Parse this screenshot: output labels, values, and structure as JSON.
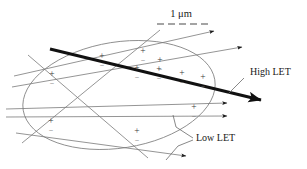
{
  "figure": {
    "name": "radiation-track-structure-in-cell-nucleus",
    "background_color": "#ffffff",
    "width": 307,
    "height": 169
  },
  "scale_bar": {
    "label": "1 μm",
    "label_x": 181,
    "label_y": 17,
    "bar_y": 24,
    "bar_x_start": 157,
    "bar_x_end": 208,
    "dash_pattern": "7,4",
    "color": "#4a4a4a"
  },
  "labels": {
    "high_let": {
      "text": "High LET",
      "x": 250,
      "y": 75,
      "color": "#1a1a1a"
    },
    "low_let": {
      "text": "Low LET",
      "x": 196,
      "y": 141,
      "color": "#1a1a1a"
    }
  },
  "nucleus": {
    "name": "cell-nucleus-ellipse",
    "cx": 119,
    "cy": 95,
    "rx": 97,
    "ry": 53,
    "rotation": -9,
    "stroke": "#8a8a8a",
    "stroke_width": 0.9,
    "fill": "none"
  },
  "high_let_track": {
    "name": "high-let-track",
    "x1": 50,
    "y1": 49,
    "x2": 261,
    "y2": 100,
    "stroke": "#111111",
    "stroke_width": 3.0,
    "arrowhead": "filled-triangle"
  },
  "low_let_tracks": [
    {
      "id": "track-a",
      "x1": 14,
      "y1": 76,
      "x2": 214,
      "y2": 31,
      "arrow": true
    },
    {
      "id": "track-b",
      "x1": 12,
      "y1": 87,
      "x2": 242,
      "y2": 47,
      "arrow": true
    },
    {
      "id": "track-c",
      "x1": 6,
      "y1": 109,
      "x2": 227,
      "y2": 103,
      "arrow": true
    },
    {
      "id": "track-d",
      "x1": 6,
      "y1": 117,
      "x2": 227,
      "y2": 116,
      "arrow": true
    },
    {
      "id": "track-e",
      "x1": 16,
      "y1": 133,
      "x2": 186,
      "y2": 156,
      "arrow": true
    },
    {
      "id": "track-f",
      "x1": 28,
      "y1": 55,
      "x2": 148,
      "y2": 158,
      "arrow": false
    },
    {
      "id": "track-g",
      "x1": 22,
      "y1": 143,
      "x2": 160,
      "y2": 30,
      "arrow": false
    }
  ],
  "low_let_stroke": "#7a7a7a",
  "low_let_stroke_width": 0.8,
  "ion_pairs": [
    {
      "x": 102,
      "y": 59
    },
    {
      "x": 143,
      "y": 54
    },
    {
      "x": 160,
      "y": 63
    },
    {
      "x": 52,
      "y": 77
    },
    {
      "x": 137,
      "y": 71
    },
    {
      "x": 159,
      "y": 72
    },
    {
      "x": 182,
      "y": 76
    },
    {
      "x": 203,
      "y": 80
    },
    {
      "x": 194,
      "y": 110
    },
    {
      "x": 51,
      "y": 124
    },
    {
      "x": 137,
      "y": 134
    }
  ],
  "leader_lines": {
    "high_let_leader": {
      "x1": 244,
      "y1": 78,
      "x2": 228,
      "y2": 94
    },
    "low_let_leaders": [
      {
        "x1": 193,
        "y1": 138,
        "x2": 176,
        "y2": 127
      },
      {
        "x1": 176,
        "y1": 127,
        "x2": 173,
        "y2": 115
      },
      {
        "x1": 193,
        "y1": 140,
        "x2": 178,
        "y2": 146
      },
      {
        "x1": 178,
        "y1": 146,
        "x2": 166,
        "y2": 160
      }
    ],
    "color": "#6a6a6a"
  }
}
